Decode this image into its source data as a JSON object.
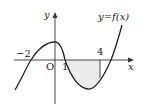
{
  "diagram": {
    "type": "function-graph",
    "function_label": "y=f(x)",
    "axes": {
      "x_label": "x",
      "y_label": "y",
      "origin_label": "O"
    },
    "tick_labels": {
      "neg_two": "−2",
      "one": "1",
      "four": "4"
    },
    "features": {
      "roots": [
        -2,
        1,
        5
      ],
      "shaded_region": {
        "from": 1,
        "to": 4,
        "description": "region between curve and x-axis"
      },
      "vertical_line_at": 4
    },
    "colors": {
      "curve": "#222222",
      "axis": "#333333",
      "shade": "#eeeeee"
    }
  }
}
